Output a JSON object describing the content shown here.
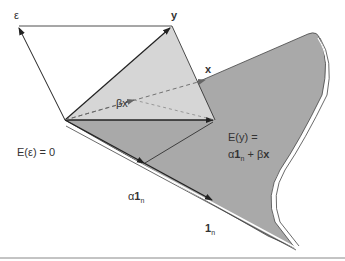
{
  "diagram": {
    "title": "",
    "colors": {
      "plane_fill": "#a9a9a9",
      "triangle_fill": "#d6d6d6",
      "line": "#222222",
      "dashed": "#666666",
      "rule": "#888888"
    },
    "labels": {
      "epsilon": "ε",
      "y": "y",
      "x": "x",
      "beta_x": "βx",
      "origin": "E(ε) = 0",
      "e_y_line1": "E(y) =",
      "e_y_line2_alpha": "α",
      "e_y_line2_one": "1",
      "e_y_line2_sub": "n",
      "e_y_line2_rest": " + β",
      "e_y_line2_x": "x",
      "alpha_prefix": "α",
      "alpha_one": "1",
      "alpha_sub": "n",
      "one": "1",
      "one_sub": "n"
    }
  }
}
